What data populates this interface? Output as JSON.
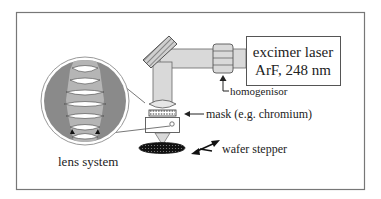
{
  "diagram": {
    "laser": {
      "line1": "excimer laser",
      "line2": "ArF, 248 nm"
    },
    "labels": {
      "homogenisor": "homogenisor",
      "mask": "mask (e.g. chromium)",
      "wafer_stepper": "wafer stepper",
      "lens_system": "lens system"
    },
    "colors": {
      "frame": "#777777",
      "beam": "#d9d9d9",
      "lens_circle_bg": "#8a8a8a",
      "lens_column": "#b5b5b5",
      "wafer": "#111111"
    }
  }
}
